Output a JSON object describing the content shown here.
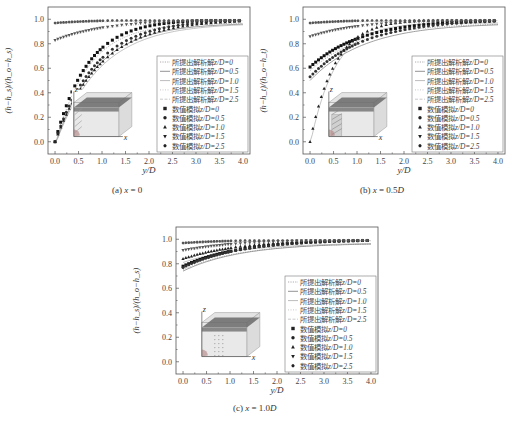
{
  "figure": {
    "panels": [
      {
        "id": "a",
        "caption_prefix": "(a) ",
        "caption_var": "x",
        "caption_eq": " = 0",
        "caption_unit": ""
      },
      {
        "id": "b",
        "caption_prefix": "(b) ",
        "caption_var": "x",
        "caption_eq": " = 0.5",
        "caption_unit": "D"
      },
      {
        "id": "c",
        "caption_prefix": "(c) ",
        "caption_var": "x",
        "caption_eq": " = 1.0",
        "caption_unit": "D"
      }
    ]
  },
  "chart_data": [
    {
      "type": "line+scatter",
      "title": "(a) x = 0",
      "xlabel": "y/D",
      "ylabel": "(h−h_s)/(h_o−h_s)",
      "xlim": [
        -0.15,
        4.15
      ],
      "ylim": [
        -0.1,
        1.1
      ],
      "xticks": [
        "0.0",
        "0.5",
        "1.0",
        "1.5",
        "2.0",
        "2.5",
        "3.0",
        "3.5",
        "4.0"
      ],
      "yticks": [
        "0.0",
        "0.2",
        "0.4",
        "0.6",
        "0.8",
        "1.0"
      ],
      "grid": false,
      "legend_position": "lower right inside",
      "legend": [
        {
          "label": "所提出解析解",
          "z": "z/D=0",
          "kind": "line",
          "style": "dotted"
        },
        {
          "label": "所提出解析解",
          "z": "z/D=0.5",
          "kind": "line",
          "style": "solid"
        },
        {
          "label": "所提出解析解",
          "z": "z/D=1.0",
          "kind": "line",
          "style": "solid-light"
        },
        {
          "label": "所提出解析解",
          "z": "z/D=1.5",
          "kind": "line",
          "style": "dotted-light"
        },
        {
          "label": "所提出解析解",
          "z": "z/D=2.5",
          "kind": "line",
          "style": "dash-light"
        },
        {
          "label": "数值模拟",
          "z": "z/D=0",
          "kind": "marker",
          "marker": "square"
        },
        {
          "label": "数值模拟",
          "z": "z/D=0.5",
          "kind": "marker",
          "marker": "circle"
        },
        {
          "label": "数值模拟",
          "z": "z/D=1.0",
          "kind": "marker",
          "marker": "triangle-up"
        },
        {
          "label": "数值模拟",
          "z": "z/D=1.5",
          "kind": "marker",
          "marker": "triangle-down"
        },
        {
          "label": "数值模拟",
          "z": "z/D=2.5",
          "kind": "marker",
          "marker": "hexagon"
        }
      ],
      "series": [
        {
          "name": "z/D=0",
          "start": 0.0,
          "rate": 1.45,
          "color": "#111111"
        },
        {
          "name": "z/D=0.5",
          "start": 0.0,
          "rate": 1.15,
          "color": "#333333"
        },
        {
          "name": "z/D=1.0",
          "start": 0.0,
          "rate": 1.05,
          "color": "#222222"
        },
        {
          "name": "z/D=1.5",
          "start": 0.83,
          "rate": 1.0,
          "color": "#555555"
        },
        {
          "name": "z/D=2.5",
          "start": 0.97,
          "rate": 1.0,
          "color": "#555555"
        }
      ],
      "inset": "3D box diagram with x and z axes, dark top layer, hatched face near origin"
    },
    {
      "type": "line+scatter",
      "title": "(b) x = 0.5D",
      "xlabel": "y/D",
      "ylabel": "(h−h_t)/(h_o−h_t)",
      "xlim": [
        -0.15,
        4.15
      ],
      "ylim": [
        -0.1,
        1.1
      ],
      "xticks": [
        "0.0",
        "0.5",
        "1.0",
        "1.5",
        "2.0",
        "2.5",
        "3.0",
        "3.5",
        "4.0"
      ],
      "yticks": [
        "0.0",
        "0.2",
        "0.4",
        "0.6",
        "0.8",
        "1.0"
      ],
      "grid": false,
      "legend_position": "lower right inside",
      "legend": [
        {
          "label": "所提出解析解",
          "z": "z/D=0",
          "kind": "line",
          "style": "dotted"
        },
        {
          "label": "所提出解析解",
          "z": "z/D=0.5",
          "kind": "line",
          "style": "solid"
        },
        {
          "label": "所提出解析解",
          "z": "z/D=1.0",
          "kind": "line",
          "style": "solid-light"
        },
        {
          "label": "所提出解析解",
          "z": "z/D=1.5",
          "kind": "line",
          "style": "dotted-light"
        },
        {
          "label": "所提出解析解",
          "z": "z/D=2.5",
          "kind": "line",
          "style": "dash-light"
        },
        {
          "label": "数值模拟",
          "z": "z/D=0",
          "kind": "marker",
          "marker": "square"
        },
        {
          "label": "数值模拟",
          "z": "z/D=0.5",
          "kind": "marker",
          "marker": "circle"
        },
        {
          "label": "数值模拟",
          "z": "z/D=1.0",
          "kind": "marker",
          "marker": "triangle-up"
        },
        {
          "label": "数值模拟",
          "z": "z/D=1.5",
          "kind": "marker",
          "marker": "triangle-down"
        },
        {
          "label": "数值模拟",
          "z": "z/D=2.5",
          "kind": "marker",
          "marker": "hexagon"
        }
      ],
      "series": [
        {
          "name": "z/D=0",
          "start": 0.61,
          "rate": 1.0,
          "color": "#111111"
        },
        {
          "name": "z/D=0.5",
          "start": 0.53,
          "rate": 0.95,
          "color": "#333333"
        },
        {
          "name": "z/D=1.0",
          "start": 0.0,
          "rate": 1.9,
          "color": "#222222"
        },
        {
          "name": "z/D=1.5",
          "start": 0.86,
          "rate": 1.0,
          "color": "#555555"
        },
        {
          "name": "z/D=2.5",
          "start": 0.97,
          "rate": 1.0,
          "color": "#555555"
        }
      ],
      "inset": "3D box diagram with x and z axes, dark top layer, hatched slab near origin"
    },
    {
      "type": "line+scatter",
      "title": "(c) x = 1.0D",
      "xlabel": "y/D",
      "ylabel": "(h−h_s)/(h_o−h_s)",
      "xlim": [
        -0.15,
        4.15
      ],
      "ylim": [
        -0.1,
        1.1
      ],
      "xticks": [
        "0.0",
        "0.5",
        "1.0",
        "1.5",
        "2.0",
        "2.5",
        "3.0",
        "3.5",
        "4.0"
      ],
      "yticks": [
        "0.0",
        "0.2",
        "0.4",
        "0.6",
        "0.8",
        "1.0"
      ],
      "grid": false,
      "legend_position": "lower right inside",
      "legend": [
        {
          "label": "所提出解析解",
          "z": "z/D=0",
          "kind": "line",
          "style": "dotted"
        },
        {
          "label": "所提出解析解",
          "z": "z/D=0.5",
          "kind": "line",
          "style": "solid"
        },
        {
          "label": "所提出解析解",
          "z": "z/D=1.0",
          "kind": "line",
          "style": "solid-light"
        },
        {
          "label": "所提出解析解",
          "z": "z/D=1.5",
          "kind": "line",
          "style": "dotted-light"
        },
        {
          "label": "所提出解析解",
          "z": "z/D=2.5",
          "kind": "line",
          "style": "dash-light"
        },
        {
          "label": "数值模拟",
          "z": "z/D=0",
          "kind": "marker",
          "marker": "square"
        },
        {
          "label": "数值模拟",
          "z": "z/D=0.5",
          "kind": "marker",
          "marker": "circle"
        },
        {
          "label": "数值模拟",
          "z": "z/D=1.0",
          "kind": "marker",
          "marker": "triangle-up"
        },
        {
          "label": "数值模拟",
          "z": "z/D=1.5",
          "kind": "marker",
          "marker": "triangle-down"
        },
        {
          "label": "数值模拟",
          "z": "z/D=2.5",
          "kind": "marker",
          "marker": "hexagon"
        }
      ],
      "series": [
        {
          "name": "z/D=0",
          "start": 0.78,
          "rate": 0.9,
          "color": "#111111"
        },
        {
          "name": "z/D=0.5",
          "start": 0.77,
          "rate": 0.9,
          "color": "#333333"
        },
        {
          "name": "z/D=1.0",
          "start": 0.84,
          "rate": 0.9,
          "color": "#222222"
        },
        {
          "name": "z/D=1.5",
          "start": 0.91,
          "rate": 0.9,
          "color": "#555555"
        },
        {
          "name": "z/D=2.5",
          "start": 0.97,
          "rate": 0.9,
          "color": "#555555"
        }
      ],
      "inset": "3D box diagram with x and z axes, dark top layer, dotted slab in middle"
    }
  ],
  "layout": {
    "frames": [
      {
        "left": 48,
        "top": 7,
        "width": 202,
        "height": 147,
        "cap_left": 112,
        "cap_top": 194,
        "xl_top": 173,
        "yl_left": 7
      },
      {
        "left": 303,
        "top": 7,
        "width": 202,
        "height": 147,
        "cap_left": 360,
        "cap_top": 194,
        "xl_top": 173,
        "yl_left": 262
      },
      {
        "left": 176,
        "top": 227,
        "width": 202,
        "height": 147,
        "cap_left": 233,
        "cap_top": 412,
        "xl_top": 393,
        "yl_left": 135
      }
    ]
  }
}
